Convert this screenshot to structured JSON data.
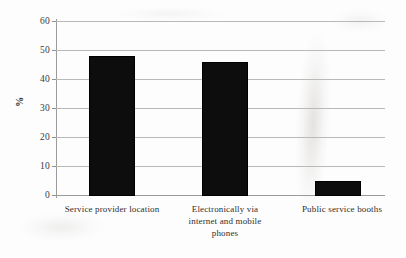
{
  "chart_data": {
    "type": "bar",
    "title": "",
    "subtitle": "",
    "xlabel": "",
    "ylabel": "%",
    "categories": [
      "Service provider location",
      "Electronically via internet and mobile phones",
      "Public service booths"
    ],
    "category_lines": [
      [
        "Service provider location"
      ],
      [
        "Electronically via",
        "internet and mobile",
        "phones"
      ],
      [
        "Public service booths"
      ]
    ],
    "values": [
      48,
      46,
      5
    ],
    "ylim": [
      0,
      60
    ],
    "ytick_labels": [
      "60",
      "50",
      "40",
      "30",
      "20",
      "10",
      "0"
    ],
    "ytick_values": [
      60,
      50,
      40,
      30,
      20,
      10,
      0
    ],
    "grid": true,
    "grid_axis": "y",
    "legend": "none",
    "legend_position": "none",
    "series": [
      {
        "name": "",
        "values": [
          48,
          46,
          5
        ],
        "color": "#0d0d0d"
      }
    ],
    "colors": {
      "bar": "#0d0d0d",
      "gridline": "#b9b9b9",
      "axis": "#9a9a9a",
      "text": "#2b2b2b",
      "background": "#fdfdfd"
    }
  }
}
